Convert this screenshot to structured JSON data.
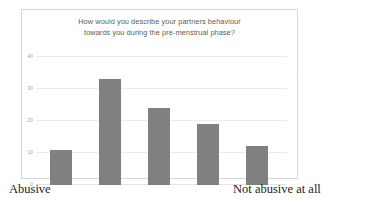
{
  "chart_data": {
    "type": "bar",
    "title": "How would you describe your partners behaviour towards you during the pre-menstrual phase?",
    "title_line1": "How would you describe your partners behaviour",
    "title_line2": "towards you during the pre-menstrual phase?",
    "categories": [
      "1",
      "2",
      "3",
      "4",
      "5"
    ],
    "values": [
      11,
      33,
      24,
      19,
      12
    ],
    "xlabel": "",
    "ylabel": "",
    "ylim": [
      0,
      40
    ],
    "yticks": [
      "0",
      "10",
      "20",
      "30",
      "40"
    ],
    "ytick_values": [
      0,
      10,
      20,
      30,
      40
    ],
    "grid": true,
    "legend": false,
    "bar_color": "#808080",
    "axis_endpoint_left": "Abusive",
    "axis_endpoint_right": "Not abusive at all"
  },
  "axis": {
    "left_label": "Abusive",
    "right_label": "Not abusive at all"
  },
  "colors": {
    "bar": "#808080",
    "gridline": "#ebebeb",
    "title_text": "#5d5d5d",
    "tick_text": "#a8a8a8",
    "frame_border": "#d8d8d8"
  },
  "artifact": {
    "mark": "'"
  }
}
